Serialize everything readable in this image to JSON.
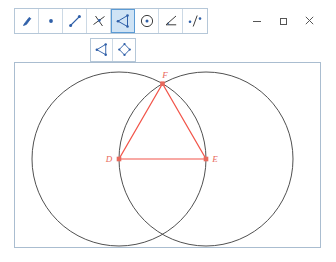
{
  "window": {
    "controls": [
      {
        "name": "minimize",
        "label": "–"
      },
      {
        "name": "maximize",
        "label": "□"
      },
      {
        "name": "close",
        "label": "✕"
      }
    ]
  },
  "toolbar_primary": {
    "tools": [
      {
        "id": "pointer",
        "icon": "pointer-arrow-icon",
        "label": "Move",
        "selected": false
      },
      {
        "id": "point",
        "icon": "point-icon",
        "label": "Point",
        "selected": false
      },
      {
        "id": "segment",
        "icon": "segment-icon",
        "label": "Line",
        "selected": false
      },
      {
        "id": "perpendicular",
        "icon": "perpendicular-line-icon",
        "label": "Perpendicular Line",
        "selected": false
      },
      {
        "id": "polygon",
        "icon": "polygon-icon",
        "label": "Polygon",
        "selected": true
      },
      {
        "id": "circle",
        "icon": "circle-with-center-icon",
        "label": "Circle",
        "selected": false
      },
      {
        "id": "angle",
        "icon": "angle-icon",
        "label": "Angle",
        "selected": false
      },
      {
        "id": "reflect",
        "icon": "reflect-about-line-icon",
        "label": "Reflect about Line",
        "selected": false
      }
    ]
  },
  "toolbar_secondary": {
    "tools": [
      {
        "id": "polygon-sub",
        "icon": "polygon-icon",
        "label": "Polygon",
        "selected": false
      },
      {
        "id": "rigid-polygon",
        "icon": "rigid-polygon-icon",
        "label": "Rigid Polygon",
        "selected": false
      }
    ]
  },
  "canvas": {
    "colors": {
      "construction_stroke": "#3c3c3c",
      "figure_stroke": "#f2554a",
      "point_fill": "#e8695c",
      "label_color": "#e8695c",
      "background": "#ffffff"
    },
    "circles": [
      {
        "name": "circle-D",
        "cx": 104,
        "cy": 96,
        "r": 87,
        "center_point": "D"
      },
      {
        "name": "circle-E",
        "cx": 191,
        "cy": 96,
        "r": 87,
        "center_point": "E"
      }
    ],
    "points": [
      {
        "name": "D",
        "label": "D",
        "x": 104,
        "y": 96,
        "label_dx": -9,
        "label_dy": 2
      },
      {
        "name": "E",
        "label": "E",
        "x": 191,
        "y": 96,
        "label_dx": 5,
        "label_dy": 2
      },
      {
        "name": "F",
        "label": "F",
        "x": 147.5,
        "y": 20.7,
        "label_dx": 1,
        "label_dy": -5
      }
    ],
    "triangle": {
      "name": "triangle-DEF",
      "vertices": [
        "D",
        "E",
        "F"
      ],
      "points_path": "104,96 191,96 147.5,20.7"
    }
  }
}
